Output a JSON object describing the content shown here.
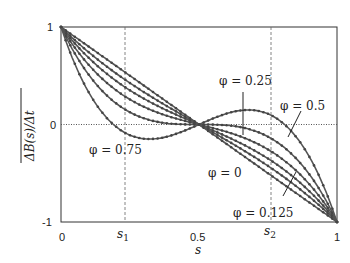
{
  "chart_data": {
    "type": "line",
    "title": "",
    "xlabel": "s",
    "ylabel": "ΔB(s)/Δt (overlined)",
    "xlim": [
      0,
      1
    ],
    "ylim": [
      -1,
      1
    ],
    "x_ticks": [
      "0",
      "s1",
      "0.5",
      "s2",
      "1"
    ],
    "x_tick_values": [
      0,
      0.35,
      0.5,
      0.65,
      1
    ],
    "y_ticks": [
      "1",
      "0",
      "-1"
    ],
    "y_tick_values": [
      1,
      0,
      -1
    ],
    "grid": "dashed vertical lines at s1 and s2, dotted horizontal line at 0",
    "legend": "none (inline annotations)",
    "model": "y = (1-2s)(1 - c*s*(1-s))",
    "series": [
      {
        "name": "curve-top",
        "c": 0
      },
      {
        "name": "φ = 0.125",
        "c": 0.8
      },
      {
        "name": "φ = 0",
        "c": 1.6
      },
      {
        "name": "φ = 0.5",
        "c": 2.6
      },
      {
        "name": "φ = 0.25",
        "c": 4.0
      },
      {
        "name": "φ = 0.75",
        "c": 6.5
      }
    ],
    "annotations": [
      {
        "text": "φ = 0.25",
        "x": 0.72,
        "y": 0.38
      },
      {
        "text": "φ = 0.5",
        "x": 0.9,
        "y": 0.22
      },
      {
        "text": "φ = 0.75",
        "x": 0.2,
        "y": -0.2
      },
      {
        "text": "φ = 0",
        "x": 0.6,
        "y": -0.4
      },
      {
        "text": "φ = 0.125",
        "x": 0.75,
        "y": -0.92
      }
    ]
  },
  "labels": {
    "y_tick_top": "1",
    "y_tick_mid": "0",
    "y_tick_bot": "-1",
    "x_tick_0": "0",
    "x_tick_s1": "s",
    "x_tick_s1_sub": "1",
    "x_tick_half": "0.5",
    "x_tick_s2": "s",
    "x_tick_s2_sub": "2",
    "x_tick_1": "1",
    "x_label": "s",
    "y_label": "ΔB(s)/Δt",
    "ann_025": "φ = 0.25",
    "ann_05": "φ = 0.5",
    "ann_075": "φ = 0.75",
    "ann_0": "φ = 0",
    "ann_0125": "φ = 0.125"
  }
}
